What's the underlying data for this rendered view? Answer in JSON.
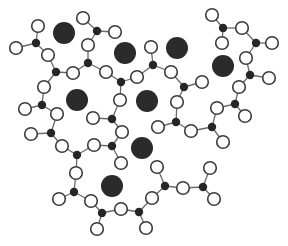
{
  "colors": {
    "background": "#ffffff",
    "cation": "#2b2b2b",
    "center_atom": "#262626",
    "open_atom_fill": "#ffffff",
    "open_atom_stroke": "#3a3a3a",
    "bond": "#6a6a6a"
  },
  "sizes": {
    "cation_r": 11,
    "center_r": 4.2,
    "open_r": 6.3
  },
  "cations": [
    {
      "x": 64,
      "y": 33
    },
    {
      "x": 125,
      "y": 53
    },
    {
      "x": 177,
      "y": 48
    },
    {
      "x": 223,
      "y": 66
    },
    {
      "x": 77,
      "y": 100
    },
    {
      "x": 147,
      "y": 101
    },
    {
      "x": 142,
      "y": 148
    },
    {
      "x": 112,
      "y": 186
    }
  ],
  "units": [
    {
      "center": {
        "x": 36,
        "y": 43
      },
      "ligands": [
        {
          "x": 38,
          "y": 26
        },
        {
          "x": 16,
          "y": 48
        },
        {
          "x": 48,
          "y": 55
        }
      ]
    },
    {
      "center": {
        "x": 56,
        "y": 72
      },
      "ligands": [
        {
          "x": 48,
          "y": 55
        },
        {
          "x": 73,
          "y": 73
        },
        {
          "x": 44,
          "y": 87
        }
      ]
    },
    {
      "center": {
        "x": 88,
        "y": 63
      },
      "ligands": [
        {
          "x": 88,
          "y": 45
        },
        {
          "x": 73,
          "y": 73
        },
        {
          "x": 106,
          "y": 72
        }
      ]
    },
    {
      "center": {
        "x": 97,
        "y": 31
      },
      "ligands": [
        {
          "x": 83,
          "y": 18
        },
        {
          "x": 115,
          "y": 32
        },
        {
          "x": 88,
          "y": 45
        }
      ]
    },
    {
      "center": {
        "x": 121,
        "y": 82
      },
      "ligands": [
        {
          "x": 106,
          "y": 72
        },
        {
          "x": 137,
          "y": 77
        },
        {
          "x": 120,
          "y": 100
        }
      ]
    },
    {
      "center": {
        "x": 153,
        "y": 65
      },
      "ligands": [
        {
          "x": 151,
          "y": 47
        },
        {
          "x": 137,
          "y": 77
        },
        {
          "x": 171,
          "y": 72
        }
      ]
    },
    {
      "center": {
        "x": 184,
        "y": 87
      },
      "ligands": [
        {
          "x": 171,
          "y": 72
        },
        {
          "x": 202,
          "y": 82
        },
        {
          "x": 177,
          "y": 102
        }
      ]
    },
    {
      "center": {
        "x": 223,
        "y": 28
      },
      "ligands": [
        {
          "x": 212,
          "y": 15
        },
        {
          "x": 242,
          "y": 28
        },
        {
          "x": 222,
          "y": 43
        }
      ]
    },
    {
      "center": {
        "x": 256,
        "y": 43
      },
      "ligands": [
        {
          "x": 242,
          "y": 28
        },
        {
          "x": 272,
          "y": 43
        },
        {
          "x": 246,
          "y": 58
        }
      ]
    },
    {
      "center": {
        "x": 250,
        "y": 75
      },
      "ligands": [
        {
          "x": 246,
          "y": 58
        },
        {
          "x": 269,
          "y": 78
        },
        {
          "x": 239,
          "y": 87
        }
      ]
    },
    {
      "center": {
        "x": 235,
        "y": 104
      },
      "ligands": [
        {
          "x": 239,
          "y": 87
        },
        {
          "x": 217,
          "y": 108
        },
        {
          "x": 245,
          "y": 116
        }
      ]
    },
    {
      "center": {
        "x": 212,
        "y": 127
      },
      "ligands": [
        {
          "x": 217,
          "y": 108
        },
        {
          "x": 191,
          "y": 131
        },
        {
          "x": 223,
          "y": 142
        }
      ]
    },
    {
      "center": {
        "x": 176,
        "y": 122
      },
      "ligands": [
        {
          "x": 177,
          "y": 102
        },
        {
          "x": 158,
          "y": 127
        },
        {
          "x": 191,
          "y": 131
        }
      ]
    },
    {
      "center": {
        "x": 112,
        "y": 119
      },
      "ligands": [
        {
          "x": 120,
          "y": 100
        },
        {
          "x": 93,
          "y": 118
        },
        {
          "x": 122,
          "y": 132
        }
      ]
    },
    {
      "center": {
        "x": 112,
        "y": 146
      },
      "ligands": [
        {
          "x": 122,
          "y": 132
        },
        {
          "x": 94,
          "y": 145
        },
        {
          "x": 121,
          "y": 163
        }
      ]
    },
    {
      "center": {
        "x": 42,
        "y": 105
      },
      "ligands": [
        {
          "x": 44,
          "y": 87
        },
        {
          "x": 25,
          "y": 109
        },
        {
          "x": 57,
          "y": 114
        }
      ]
    },
    {
      "center": {
        "x": 51,
        "y": 133
      },
      "ligands": [
        {
          "x": 57,
          "y": 114
        },
        {
          "x": 31,
          "y": 134
        },
        {
          "x": 62,
          "y": 146
        }
      ]
    },
    {
      "center": {
        "x": 77,
        "y": 155
      },
      "ligands": [
        {
          "x": 62,
          "y": 146
        },
        {
          "x": 94,
          "y": 145
        },
        {
          "x": 76,
          "y": 173
        }
      ]
    },
    {
      "center": {
        "x": 74,
        "y": 192
      },
      "ligands": [
        {
          "x": 76,
          "y": 173
        },
        {
          "x": 59,
          "y": 199
        },
        {
          "x": 91,
          "y": 201
        }
      ]
    },
    {
      "center": {
        "x": 102,
        "y": 213
      },
      "ligands": [
        {
          "x": 91,
          "y": 201
        },
        {
          "x": 121,
          "y": 209
        },
        {
          "x": 97,
          "y": 229
        }
      ]
    },
    {
      "center": {
        "x": 139,
        "y": 212
      },
      "ligands": [
        {
          "x": 121,
          "y": 209
        },
        {
          "x": 152,
          "y": 198
        },
        {
          "x": 146,
          "y": 228
        }
      ]
    },
    {
      "center": {
        "x": 165,
        "y": 186
      },
      "ligands": [
        {
          "x": 152,
          "y": 198
        },
        {
          "x": 157,
          "y": 167
        },
        {
          "x": 183,
          "y": 188
        }
      ]
    },
    {
      "center": {
        "x": 203,
        "y": 187
      },
      "ligands": [
        {
          "x": 183,
          "y": 188
        },
        {
          "x": 210,
          "y": 168
        },
        {
          "x": 214,
          "y": 199
        }
      ]
    }
  ]
}
